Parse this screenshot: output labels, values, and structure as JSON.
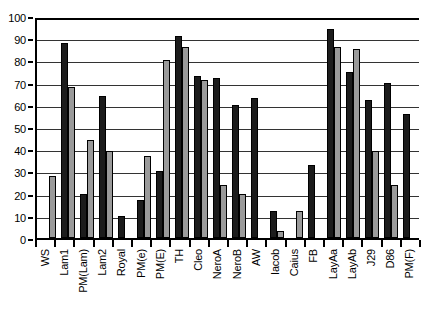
{
  "chart_data": {
    "type": "bar",
    "title": "",
    "subtitle": "",
    "xlabel": "",
    "ylabel": "",
    "ylim": [
      0,
      100
    ],
    "ytick_step": 10,
    "yticks": [
      0,
      10,
      20,
      30,
      40,
      50,
      60,
      70,
      80,
      90,
      100
    ],
    "grid": true,
    "legend": "none",
    "categories": [
      "WS",
      "Lam1",
      "PM(Lam)",
      "Lam2",
      "Royal",
      "PM(e)",
      "PM(E)",
      "TH",
      "Cleo",
      "NeroA",
      "NeroB",
      "AW",
      "Iacob",
      "Caius",
      "FB",
      "LayAa",
      "LayAb",
      "J29",
      "D86",
      "PM(F)"
    ],
    "series": [
      {
        "name": "series-1",
        "color": "#1c1c1c",
        "values": [
          0,
          88,
          20,
          64,
          10,
          17,
          30,
          91,
          73,
          72,
          60,
          63,
          12,
          0,
          33,
          94,
          75,
          62,
          70,
          56
        ]
      },
      {
        "name": "series-2",
        "color": "#9a9a9a",
        "values": [
          28,
          68,
          44,
          39,
          0,
          37,
          80,
          86,
          71,
          24,
          20,
          0,
          3,
          12,
          0,
          86,
          85,
          39,
          24,
          0
        ]
      }
    ],
    "colors": {
      "series_dark": "#1c1c1c",
      "series_light": "#9a9a9a",
      "axis": "#000000",
      "grid": "#333333",
      "background": "#ffffff"
    }
  }
}
